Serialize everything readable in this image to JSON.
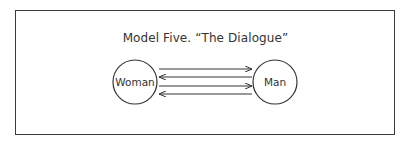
{
  "title": "Model Five.   “The Dialogue”",
  "nodes": {
    "left": "Woman",
    "right": "Man"
  },
  "arrows": [
    {
      "direction": "left-to-right"
    },
    {
      "direction": "right-to-left"
    },
    {
      "direction": "left-to-right"
    },
    {
      "direction": "right-to-left"
    }
  ],
  "colors": {
    "ink": "#333333",
    "background": "#ffffff"
  }
}
